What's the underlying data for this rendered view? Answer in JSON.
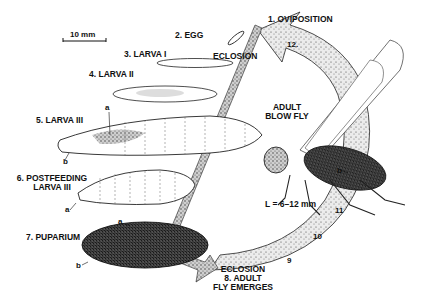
{
  "diagram": {
    "scale_bar": "10 mm",
    "stages": [
      {
        "id": 1,
        "label": "1. OVIPOSITION"
      },
      {
        "id": 2,
        "label": "2. EGG"
      },
      {
        "id": 3,
        "label": "3. LARVA I"
      },
      {
        "id": 4,
        "label": "4. LARVA II"
      },
      {
        "id": 5,
        "label": "5. LARVA III"
      },
      {
        "id": 6,
        "label_line1": "6. POSTFEEDING",
        "label_line2": "LARVA III"
      },
      {
        "id": 7,
        "label": "7. PUPARIUM"
      },
      {
        "id": 8,
        "label_line1": "8. ADULT",
        "label_line2": "FLY EMERGES"
      }
    ],
    "eclosion_top": "ECLOSION",
    "eclosion_bottom": "ECLOSION",
    "adult": {
      "line1": "ADULT",
      "line2": "BLOW FLY",
      "size": "L = 6–12 mm"
    },
    "arrow_numbers": [
      "9",
      "10",
      "11",
      "12."
    ],
    "part_letters": {
      "a": "a",
      "b": "b"
    },
    "colors": {
      "ink": "#111111",
      "stipple": "#6a6a6a",
      "background": "#ffffff"
    }
  }
}
